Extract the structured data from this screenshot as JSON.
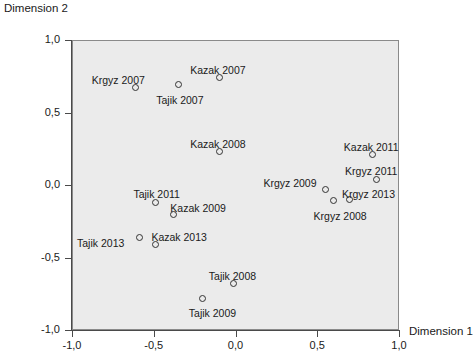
{
  "chart_data": {
    "type": "scatter",
    "title": "",
    "xlabel": "Dimension 1",
    "ylabel": "Dimension 2",
    "xlim": [
      -1.0,
      1.0
    ],
    "ylim": [
      -1.0,
      1.0
    ],
    "xticks": [
      "-1,0",
      "-0,5",
      "0,0",
      "0,5",
      "1,0"
    ],
    "xtick_values": [
      -1.0,
      -0.5,
      0.0,
      0.5,
      1.0
    ],
    "yticks": [
      "1,0",
      "0,5",
      "0,0",
      "-0,5",
      "-1,0"
    ],
    "ytick_values": [
      1.0,
      0.5,
      0.0,
      -0.5,
      -1.0
    ],
    "grid": false,
    "legend": "none",
    "marker": "open-circle",
    "plot_background": "#ebebeb",
    "points": [
      {
        "label": "Krgyz 2007",
        "x": -0.61,
        "y": 0.67,
        "label_dx": -44,
        "label_dy": -14
      },
      {
        "label": "Tajik 2007",
        "x": -0.35,
        "y": 0.69,
        "label_dx": -22,
        "label_dy": 9
      },
      {
        "label": "Kazak 2007",
        "x": -0.1,
        "y": 0.74,
        "label_dx": -29,
        "label_dy": -14
      },
      {
        "label": "Kazak 2008",
        "x": -0.1,
        "y": 0.23,
        "label_dx": -29,
        "label_dy": -14
      },
      {
        "label": "Kazak 2011",
        "x": 0.84,
        "y": 0.21,
        "label_dx": -29,
        "label_dy": -14
      },
      {
        "label": "Krgyz 2011",
        "x": 0.86,
        "y": 0.04,
        "label_dx": -31,
        "label_dy": -14
      },
      {
        "label": "Krgyz 2009",
        "x": 0.55,
        "y": -0.03,
        "label_dx": -62,
        "label_dy": -12
      },
      {
        "label": "Krgyz 2013",
        "x": 0.7,
        "y": -0.1,
        "label_dx": -8,
        "label_dy": -12
      },
      {
        "label": "Krgyz 2008",
        "x": 0.6,
        "y": -0.11,
        "label_dx": -20,
        "label_dy": 9
      },
      {
        "label": "Tajik 2011",
        "x": -0.49,
        "y": -0.12,
        "label_dx": -22,
        "label_dy": -14
      },
      {
        "label": "Kazak 2009",
        "x": -0.38,
        "y": -0.2,
        "label_dx": -3,
        "label_dy": -12
      },
      {
        "label": "Tajik 2013",
        "x": -0.59,
        "y": -0.36,
        "label_dx": -62,
        "label_dy": 0
      },
      {
        "label": "Kazak 2013",
        "x": -0.49,
        "y": -0.41,
        "label_dx": -4,
        "label_dy": -13
      },
      {
        "label": "Tajik 2008",
        "x": -0.01,
        "y": -0.68,
        "label_dx": -25,
        "label_dy": -14
      },
      {
        "label": "Tajik 2009",
        "x": -0.2,
        "y": -0.78,
        "label_dx": -14,
        "label_dy": 9
      }
    ]
  }
}
